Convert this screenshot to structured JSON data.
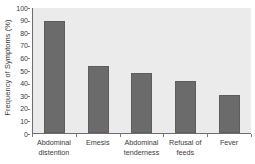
{
  "chart_data": {
    "type": "bar",
    "title": "",
    "xlabel": "",
    "ylabel": "Frequency of Symptoms (%)",
    "categories": [
      "Abdominal distention",
      "Emesis",
      "Abdominal tenderness",
      "Refusal of feeds",
      "Fever"
    ],
    "category_lines": [
      [
        "Abdominal",
        "distention"
      ],
      [
        "Emesis",
        ""
      ],
      [
        "Abdominal",
        "tenderness"
      ],
      [
        "Refusal of",
        "feeds"
      ],
      [
        "Fever",
        ""
      ]
    ],
    "values": [
      89,
      53,
      47.5,
      41,
      30
    ],
    "ylim": [
      0,
      100
    ],
    "ytick_labels": [
      "100",
      "90",
      "80",
      "70",
      "60",
      "50",
      "40",
      "30",
      "20",
      "10",
      "0"
    ],
    "ytick_values": [
      100,
      90,
      80,
      70,
      60,
      50,
      40,
      30,
      20,
      10,
      0
    ],
    "grid": false,
    "legend": false,
    "colors": {
      "bar": "#6b6b6b",
      "bar_edge": "#5d5d5d",
      "plot_background": "#ebebeb",
      "axis": "#6e6e6e",
      "text": "#3a3a3a",
      "figure_background": "#ffffff"
    }
  }
}
